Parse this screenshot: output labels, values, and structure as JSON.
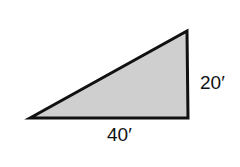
{
  "diagram": {
    "shape": "right-triangle",
    "fill_color": "#cfcfcf",
    "stroke_color": "#111111",
    "labels": {
      "base": "40′",
      "height": "20′"
    }
  }
}
